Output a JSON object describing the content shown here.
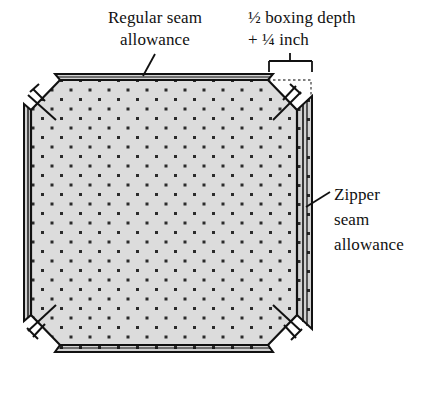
{
  "figure": {
    "background_color": "#ffffff",
    "ink_color": "#111111",
    "panel_fill_color": "#d9d9d9",
    "allowance_fill_color": "#c9c9c9",
    "dot_color": "#2b2b2b",
    "dotted_guide_color": "#555555"
  },
  "labels": {
    "regular_seam": {
      "lines": [
        "Regular seam",
        "allowance"
      ],
      "align": "center"
    },
    "boxing_depth": {
      "lines": [
        "½ boxing depth",
        "+ ¼ inch"
      ],
      "align": "left"
    },
    "zipper_seam": {
      "lines": [
        "Zipper",
        "seam",
        "allowance"
      ],
      "align": "left"
    }
  },
  "annotations": {
    "boxing_bracket": "dimension-bracket",
    "regular_seam_leader": "leader-line",
    "zipper_seam_leader": "leader-line",
    "corner_marks": [
      "top-left",
      "top-right",
      "bottom-left",
      "bottom-right"
    ]
  }
}
